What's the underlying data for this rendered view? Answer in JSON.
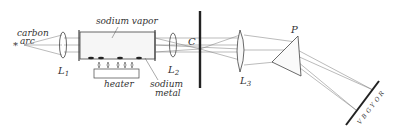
{
  "figure": {
    "labels": {
      "source": "carbon arc",
      "source_line1": "carbon",
      "source_line2": "arc",
      "source_symbol": "*",
      "lens1": "L",
      "lens1_sub": "1",
      "vapor": "sodium vapor",
      "heater": "heater",
      "lens2": "L",
      "lens2_sub": "2",
      "metal_line1": "sodium",
      "metal_line2": "metal",
      "slit": "C",
      "lens3": "L",
      "lens3_sub": "3",
      "prism": "P",
      "spectrum": [
        "V",
        "B",
        "G",
        "Y",
        "O",
        "R"
      ]
    }
  }
}
